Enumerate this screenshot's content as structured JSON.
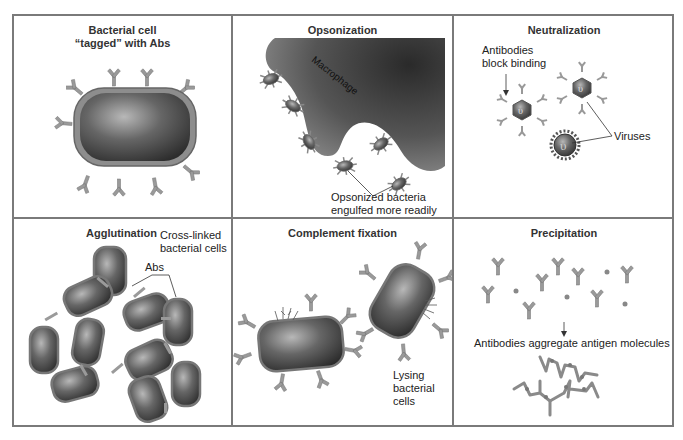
{
  "figure": {
    "layout": "2x3 grid of panels",
    "border_color": "#7a7a7a",
    "antibody_color": "#9a9a9a",
    "cell_color": "#4a4a4a"
  },
  "panels": [
    {
      "id": "tagged",
      "title_line1": "Bacterial cell",
      "title_line2": "“tagged” with Abs",
      "labels": []
    },
    {
      "id": "opsonization",
      "title": "Opsonization",
      "labels": {
        "macrophage": "Macrophage",
        "callout_line1": "Opsonized bacteria",
        "callout_line2": "engulfed more readily"
      }
    },
    {
      "id": "neutralization",
      "title": "Neutralization",
      "labels": {
        "block_line1": "Antibodies",
        "block_line2": "block binding",
        "viruses": "Viruses"
      }
    },
    {
      "id": "agglutination",
      "title": "Agglutination",
      "labels": {
        "crosslinked_line1": "Cross-linked",
        "crosslinked_line2": "bacterial cells",
        "abs": "Abs"
      }
    },
    {
      "id": "complement",
      "title": "Complement fixation",
      "labels": {
        "lysing_line1": "Lysing",
        "lysing_line2": "bacterial",
        "lysing_line3": "cells"
      }
    },
    {
      "id": "precipitation",
      "title": "Precipitation",
      "labels": {
        "aggregate": "Antibodies aggregate antigen molecules"
      }
    }
  ]
}
